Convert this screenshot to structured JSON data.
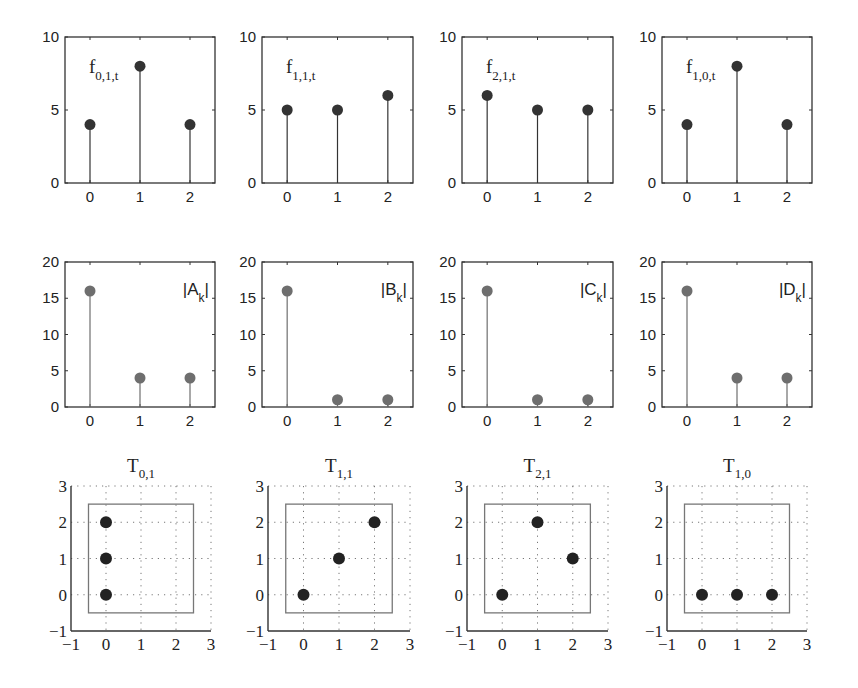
{
  "figure": {
    "rows": 3,
    "cols": 4
  },
  "chart_data": [
    {
      "type": "stem",
      "panel": "row1-col1",
      "label": "f",
      "label_sub": "0,1,t",
      "x": [
        0,
        1,
        2
      ],
      "values": [
        4,
        8,
        4
      ],
      "xticks": [
        "0",
        "1",
        "2"
      ],
      "yticks": [
        "0",
        "5",
        "10"
      ],
      "ylim": [
        0,
        10
      ],
      "xlim": [
        -0.5,
        2.5
      ],
      "color": "#333333"
    },
    {
      "type": "stem",
      "panel": "row1-col2",
      "label": "f",
      "label_sub": "1,1,t",
      "x": [
        0,
        1,
        2
      ],
      "values": [
        5,
        5,
        6
      ],
      "xticks": [
        "0",
        "1",
        "2"
      ],
      "yticks": [
        "0",
        "5",
        "10"
      ],
      "ylim": [
        0,
        10
      ],
      "xlim": [
        -0.5,
        2.5
      ],
      "color": "#333333"
    },
    {
      "type": "stem",
      "panel": "row1-col3",
      "label": "f",
      "label_sub": "2,1,t",
      "x": [
        0,
        1,
        2
      ],
      "values": [
        6,
        5,
        5
      ],
      "xticks": [
        "0",
        "1",
        "2"
      ],
      "yticks": [
        "0",
        "5",
        "10"
      ],
      "ylim": [
        0,
        10
      ],
      "xlim": [
        -0.5,
        2.5
      ],
      "color": "#333333"
    },
    {
      "type": "stem",
      "panel": "row1-col4",
      "label": "f",
      "label_sub": "1,0,t",
      "x": [
        0,
        1,
        2
      ],
      "values": [
        4,
        8,
        4
      ],
      "xticks": [
        "0",
        "1",
        "2"
      ],
      "yticks": [
        "0",
        "5",
        "10"
      ],
      "ylim": [
        0,
        10
      ],
      "xlim": [
        -0.5,
        2.5
      ],
      "color": "#333333"
    },
    {
      "type": "stem",
      "panel": "row2-col1",
      "label": "|A",
      "label_sub": "k",
      "label_end": "|",
      "x": [
        0,
        1,
        2
      ],
      "values": [
        16,
        4,
        4
      ],
      "xticks": [
        "0",
        "1",
        "2"
      ],
      "yticks": [
        "0",
        "5",
        "10",
        "15",
        "20"
      ],
      "ylim": [
        0,
        20
      ],
      "xlim": [
        -0.5,
        2.5
      ],
      "color": "#6e6e6e"
    },
    {
      "type": "stem",
      "panel": "row2-col2",
      "label": "|B",
      "label_sub": "k",
      "label_end": "|",
      "x": [
        0,
        1,
        2
      ],
      "values": [
        16,
        1,
        1
      ],
      "xticks": [
        "0",
        "1",
        "2"
      ],
      "yticks": [
        "0",
        "5",
        "10",
        "15",
        "20"
      ],
      "ylim": [
        0,
        20
      ],
      "xlim": [
        -0.5,
        2.5
      ],
      "color": "#6e6e6e"
    },
    {
      "type": "stem",
      "panel": "row2-col3",
      "label": "|C",
      "label_sub": "k",
      "label_end": "|",
      "x": [
        0,
        1,
        2
      ],
      "values": [
        16,
        1,
        1
      ],
      "xticks": [
        "0",
        "1",
        "2"
      ],
      "yticks": [
        "0",
        "5",
        "10",
        "15",
        "20"
      ],
      "ylim": [
        0,
        20
      ],
      "xlim": [
        -0.5,
        2.5
      ],
      "color": "#6e6e6e"
    },
    {
      "type": "stem",
      "panel": "row2-col4",
      "label": "|D",
      "label_sub": "k",
      "label_end": "|",
      "x": [
        0,
        1,
        2
      ],
      "values": [
        16,
        4,
        4
      ],
      "xticks": [
        "0",
        "1",
        "2"
      ],
      "yticks": [
        "0",
        "5",
        "10",
        "15",
        "20"
      ],
      "ylim": [
        0,
        20
      ],
      "xlim": [
        -0.5,
        2.5
      ],
      "color": "#6e6e6e"
    },
    {
      "type": "scatter",
      "panel": "row3-col1",
      "title": "T",
      "title_sub": "0,1",
      "points": [
        [
          0,
          0
        ],
        [
          0,
          1
        ],
        [
          0,
          2
        ]
      ],
      "xticks": [
        "−1",
        "0",
        "1",
        "2",
        "3"
      ],
      "yticks": [
        "−1",
        "0",
        "1",
        "2",
        "3"
      ],
      "xlim": [
        -1,
        3
      ],
      "ylim": [
        -1,
        3
      ],
      "grid": "dotted",
      "box": [
        -0.5,
        -0.5,
        2.5,
        2.5
      ],
      "color": "#222222"
    },
    {
      "type": "scatter",
      "panel": "row3-col2",
      "title": "T",
      "title_sub": "1,1",
      "points": [
        [
          0,
          0
        ],
        [
          1,
          1
        ],
        [
          2,
          2
        ]
      ],
      "xticks": [
        "−1",
        "0",
        "1",
        "2",
        "3"
      ],
      "yticks": [
        "−1",
        "0",
        "1",
        "2",
        "3"
      ],
      "xlim": [
        -1,
        3
      ],
      "ylim": [
        -1,
        3
      ],
      "grid": "dotted",
      "box": [
        -0.5,
        -0.5,
        2.5,
        2.5
      ],
      "color": "#222222"
    },
    {
      "type": "scatter",
      "panel": "row3-col3",
      "title": "T",
      "title_sub": "2,1",
      "points": [
        [
          0,
          0
        ],
        [
          2,
          1
        ],
        [
          1,
          2
        ]
      ],
      "xticks": [
        "−1",
        "0",
        "1",
        "2",
        "3"
      ],
      "yticks": [
        "−1",
        "0",
        "1",
        "2",
        "3"
      ],
      "xlim": [
        -1,
        3
      ],
      "ylim": [
        -1,
        3
      ],
      "grid": "dotted",
      "box": [
        -0.5,
        -0.5,
        2.5,
        2.5
      ],
      "color": "#222222"
    },
    {
      "type": "scatter",
      "panel": "row3-col4",
      "title": "T",
      "title_sub": "1,0",
      "points": [
        [
          0,
          0
        ],
        [
          1,
          0
        ],
        [
          2,
          0
        ]
      ],
      "xticks": [
        "−1",
        "0",
        "1",
        "2",
        "3"
      ],
      "yticks": [
        "−1",
        "0",
        "1",
        "2",
        "3"
      ],
      "xlim": [
        -1,
        3
      ],
      "ylim": [
        -1,
        3
      ],
      "grid": "dotted",
      "box": [
        -0.5,
        -0.5,
        2.5,
        2.5
      ],
      "color": "#222222"
    }
  ]
}
